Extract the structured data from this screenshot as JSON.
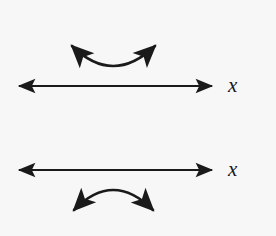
{
  "figure": {
    "background_color": "#f7f7f7",
    "ink_color": "#1a1a1a",
    "width": 276,
    "height": 236
  },
  "panels": [
    {
      "id": "top-panel",
      "axis": {
        "name": "x-axis-top",
        "label": "x",
        "label_style": "italic-serif",
        "y": 86,
        "x_start": 15,
        "x_end": 216,
        "arrowheads": [
          "left",
          "right"
        ]
      },
      "curved_arrow": {
        "name": "concave-up-arrow",
        "description": "double-headed arc opening upward (smile) above the axis",
        "curvature": "concave-up",
        "arrowheads": [
          "up-left",
          "up-right"
        ],
        "left_tip": {
          "x": 68,
          "y": 40
        },
        "right_tip": {
          "x": 159,
          "y": 40
        },
        "apex": {
          "x": 113,
          "y": 74
        },
        "position": "above-axis"
      }
    },
    {
      "id": "bottom-panel",
      "axis": {
        "name": "x-axis-bottom",
        "label": "x",
        "label_style": "italic-serif",
        "y": 170,
        "x_start": 15,
        "x_end": 216,
        "arrowheads": [
          "left",
          "right"
        ]
      },
      "curved_arrow": {
        "name": "concave-down-arrow",
        "description": "double-headed arc opening downward (frown) below the axis",
        "curvature": "concave-down",
        "arrowheads": [
          "down-left",
          "down-right"
        ],
        "left_tip": {
          "x": 70,
          "y": 216
        },
        "right_tip": {
          "x": 157,
          "y": 216
        },
        "apex": {
          "x": 113,
          "y": 182
        },
        "position": "below-axis"
      }
    }
  ],
  "labels": {
    "top_axis": "x",
    "bottom_axis": "x"
  }
}
